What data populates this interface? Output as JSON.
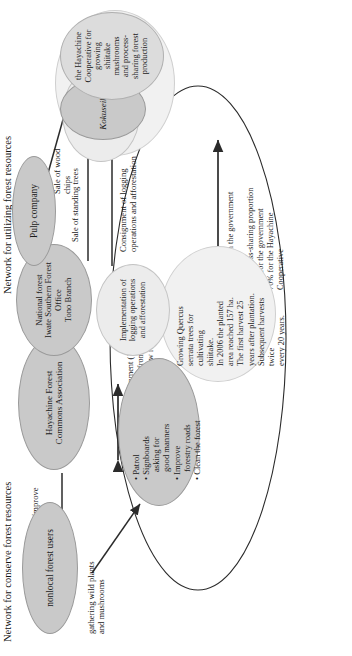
{
  "figure": {
    "headings": {
      "top": "Network for conserve forest resources",
      "bottom": "Network for utilizing forest resources"
    },
    "nodes": {
      "nonlocal_users": "nonlocal forest users",
      "hayachine_assoc": "Hayachine Forest\nCommons Association",
      "national_forest": "National forest\nIwate Southern Forest\nOffice\nTono Branch",
      "pulp_company": "Pulp company",
      "kokuseikyo": "Kokuseikyo",
      "implementation": "Implementation of\nlogging operations\nand afforestation",
      "cooperative": "the Hayachine\nCooperative for\ngrowing\nshiitake\nmushrooms\nand process-\nsharing forest\nproduction"
    },
    "activity_bullets": [
      "Patrol",
      "Signboards",
      "asking for",
      "good manners",
      "Improve",
      "forestry roads",
      "Clean the forest"
    ],
    "quercus_block": [
      "Growing Quercus",
      "serrata trees for",
      "cultivating",
      "shiitake.",
      "In 2006 the planted",
      "area reached 157 ha.",
      "The first harvest 25",
      "years after plantation.",
      "Subsequent harvests",
      "twice",
      "every 20 years."
    ],
    "labels": {
      "gathering": "gathering wild plants\nand mushrooms",
      "guidance": "Guidance to improve\nvisitors' manner",
      "contract_1998": "contract with the government (1998)\nthat allowed to collect fees from visitor\nThe idea was suggested by new residents\nmoving in from outside.",
      "contract_1985": "contract with the government\n(1985)\nthe process-sharing proportion\n30% for the government\n70% for the Hayachine\nCooperative",
      "sale_standing": "Sale of standing trees",
      "consignment": "Consignment of logging\noperations and afforestation",
      "sale_chips": "Sale of wood\nchips"
    },
    "colors": {
      "dark_fill": "#c9c9c9",
      "mid_fill": "#dcdcdc",
      "light_fill": "#ececec",
      "very_light_fill": "#f1f1f1",
      "stroke": "#2b2b2b",
      "text": "#1a1a1a"
    }
  }
}
